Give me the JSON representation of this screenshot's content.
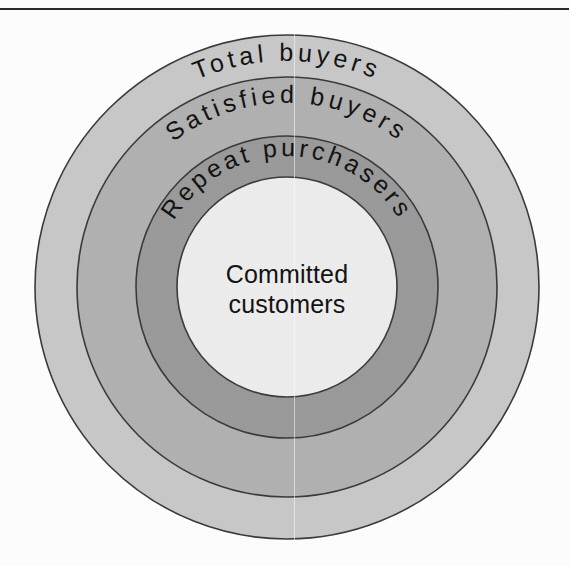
{
  "figure": {
    "title": "",
    "background_color": "#ffffff",
    "top_rule_color": "#2b2b2b",
    "center": {
      "x": 287,
      "y": 287
    }
  },
  "chart_data": {
    "type": "pie",
    "subtype": "concentric-rings",
    "title": "",
    "xlabel": "",
    "ylabel": "",
    "legend_position": "none",
    "grid": false,
    "categories": [
      "Total buyers",
      "Satisfied buyers",
      "Repeat purchasers",
      "Committed customers"
    ],
    "values": [
      252,
      210,
      151,
      110
    ],
    "units": "radius in pixels",
    "rings": [
      {
        "index": 0,
        "label": "Total buyers",
        "radius": 252,
        "fill": "#c9c9c9",
        "stroke": "#3a3a3a",
        "label_style": "curved-top",
        "text_radius": 226,
        "sweep_start_deg": -49,
        "sweep_end_deg": 49
      },
      {
        "index": 1,
        "label": "Satisfied buyers",
        "radius": 210,
        "fill": "#b2b2b2",
        "stroke": "#3a3a3a",
        "label_style": "curved-top",
        "text_radius": 184,
        "sweep_start_deg": -62,
        "sweep_end_deg": 62
      },
      {
        "index": 2,
        "label": "Repeat purchasers",
        "radius": 151,
        "fill": "#9b9b9b",
        "stroke": "#3a3a3a",
        "label_style": "curved-top",
        "text_radius": 131,
        "sweep_start_deg": -82,
        "sweep_end_deg": 82
      },
      {
        "index": 3,
        "label": "Committed customers",
        "radius": 110,
        "fill": "#eeeeee",
        "stroke": "#3a3a3a",
        "label_style": "horizontal-centered",
        "label_lines": [
          "Committed",
          "customers"
        ]
      }
    ]
  },
  "labels": {
    "ring_outer": "Total buyers",
    "ring_second": "Satisfied buyers",
    "ring_third": "Repeat purchasers",
    "center_line1": "Committed",
    "center_line2": "customers"
  },
  "colors": {
    "ring_outer_fill": "#c9c9c9",
    "ring_second_fill": "#b2b2b2",
    "ring_third_fill": "#9b9b9b",
    "center_fill": "#eeeeee",
    "stroke": "#3a3a3a",
    "text": "#121212",
    "page_background": "#ffffff"
  }
}
